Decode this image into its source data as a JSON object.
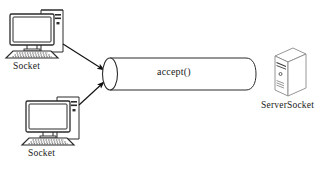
{
  "diagram": {
    "type": "network-socket-diagram",
    "background_color": "#ffffff",
    "stroke_color": "#2b2b2b",
    "text_color": "#1b1b1b",
    "nodes": [
      {
        "id": "client-top",
        "icon": "desktop-computer-icon",
        "label": "Socket",
        "role": "client"
      },
      {
        "id": "client-bottom",
        "icon": "desktop-computer-icon",
        "label": "Socket",
        "role": "client"
      },
      {
        "id": "pipe",
        "icon": "cylinder-pipe-icon",
        "label": "accept()",
        "role": "connection-channel"
      },
      {
        "id": "server",
        "icon": "server-tower-icon",
        "label": "ServerSocket",
        "role": "server"
      }
    ],
    "connections": [
      {
        "id": "arrow-top",
        "from": "client-top",
        "to": "pipe",
        "style": "solid-arrow"
      },
      {
        "id": "arrow-bottom",
        "from": "client-bottom",
        "to": "pipe",
        "style": "solid-arrow"
      }
    ],
    "labels": {
      "client_top": "Socket",
      "client_bottom": "Socket",
      "pipe": "accept()",
      "server": "ServerSocket"
    }
  }
}
